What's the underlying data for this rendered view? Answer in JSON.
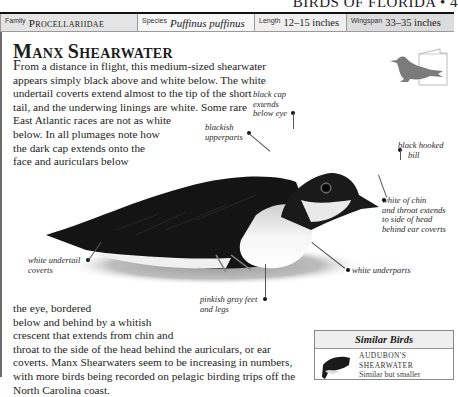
{
  "page": {
    "running_head": "Birds of Florida • 4"
  },
  "info_bar": {
    "family_label": "Family",
    "family_value": "Procellariidae",
    "species_label": "Species",
    "species_value": "Puffinus puffinus",
    "length_label": "Length",
    "length_value": "12–15 inches",
    "wingspan_label": "Wingspan",
    "wingspan_value": "33–35 inches"
  },
  "species": {
    "title_first_initial": "M",
    "title_first_rest": "anx ",
    "title_second_initial": "S",
    "title_second_rest": "hearwater",
    "intro_dropcap": "F",
    "intro_lines": [
      "rom a distance in flight, this medium-sized shearwater",
      "appears simply black above and white below. The white",
      "undertail coverts extend almost to the tip of the short",
      "tail, and the underwing linings are white. Some rare",
      "East Atlantic races are not as white",
      "below. In all plumages note how",
      "the dark cap extends onto the",
      "face and auriculars below"
    ],
    "continued_lines": [
      "the eye, bordered",
      "below and behind by a whitish",
      "crescent that extends from chin and",
      "throat to the side of the head behind the auriculars, or ear",
      "coverts. Manx Shearwaters seem to be increasing in numbers,",
      "with more birds being recorded on pelagic birding trips off the",
      "North Carolina coast."
    ]
  },
  "icons": {
    "habitat_silhouette": "perched-bird-silhouette-icon",
    "field_guide_page": "book-page-icon"
  },
  "callouts": {
    "black_cap": [
      "black cap",
      "extends",
      "below eye"
    ],
    "blackish_upperparts": [
      "blackish",
      "upperparts"
    ],
    "black_hooked_bill": [
      "black hooked",
      "bill"
    ],
    "white_chin": [
      "white of chin",
      "and throat extends",
      "to side of head",
      "behind ear coverts"
    ],
    "white_undertail": [
      "white undertail",
      "coverts"
    ],
    "white_underparts": [
      "white underparts"
    ],
    "pinkish_feet": [
      "pinkish gray feet",
      "and legs"
    ]
  },
  "similar_birds": {
    "header": "Similar Birds",
    "items": [
      {
        "name_line1": "Audubon's",
        "name_line2": "Shearwater",
        "description": "Similar but smaller"
      }
    ]
  },
  "colors": {
    "silhouette_gray": "#7b7b7b",
    "info_bar_family_bg": "#e4e4e4",
    "info_bar_wingspan_bg": "#dcdcdc",
    "rule": "#111111"
  }
}
